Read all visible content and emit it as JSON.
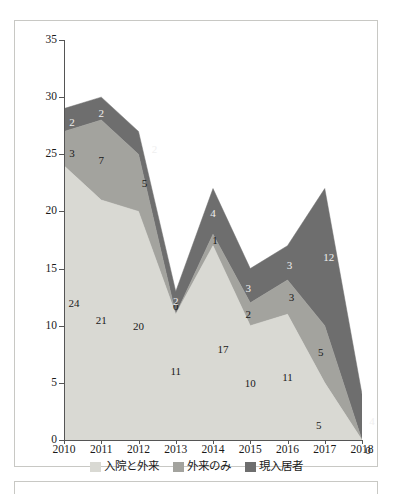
{
  "chart_data": {
    "type": "area",
    "stacked": true,
    "title": "",
    "subtitle": "",
    "xlabel": "",
    "ylabel": "",
    "categories": [
      "2010",
      "2011",
      "2012",
      "2013",
      "2014",
      "2015",
      "2016",
      "2017",
      "2018"
    ],
    "series": [
      {
        "name": "入院と外来",
        "color": "#d9d9d3",
        "values": [
          24,
          21,
          20,
          11,
          17,
          10,
          11,
          5,
          0
        ]
      },
      {
        "name": "外来のみ",
        "color": "#a3a39e",
        "values": [
          3,
          7,
          5,
          0,
          1,
          2,
          3,
          5,
          0
        ]
      },
      {
        "name": "現入居者",
        "color": "#6e6e6e",
        "values": [
          2,
          2,
          2,
          2,
          4,
          3,
          3,
          12,
          4
        ]
      }
    ],
    "totals": [
      29,
      30,
      27,
      13,
      22,
      15,
      17,
      22,
      4
    ],
    "ylim": [
      0,
      35
    ],
    "yticks": [
      0,
      5,
      10,
      15,
      20,
      25,
      30,
      35
    ],
    "ytick_labels": [
      "0",
      "5",
      "10",
      "15",
      "20",
      "25",
      "30",
      "35"
    ],
    "grid": false,
    "legend_position": "bottom",
    "legend_entries": [
      "入院と外来",
      "外来のみ",
      "現入居者"
    ],
    "data_labels": {
      "入院と外来": [
        "24",
        "21",
        "20",
        "11",
        "17",
        "10",
        "11",
        "5",
        "0"
      ],
      "外来のみ": [
        "3",
        "7",
        "5",
        "0",
        "1",
        "2",
        "3",
        "5",
        ""
      ],
      "現入居者": [
        "2",
        "2",
        "2",
        "2",
        "4",
        "3",
        "3",
        "12",
        "4"
      ]
    },
    "colors": {
      "light_gray": "#d9d9d3",
      "medium_gray": "#a3a39e",
      "dark_gray": "#6e6e6e",
      "axis": "#555555",
      "text": "#1a1a1a",
      "frame": "#c8c8c4",
      "background": "#ffffff"
    }
  }
}
